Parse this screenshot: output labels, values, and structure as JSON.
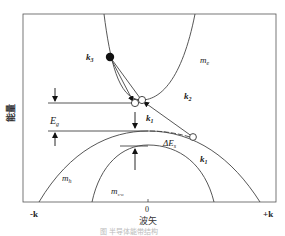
{
  "diagram": {
    "y_axis_label": "能量",
    "x_axis_label": "波矢",
    "x_ticks": {
      "left": "-k",
      "center": "0",
      "right": "+k"
    },
    "bands": [
      {
        "id": "conduction",
        "mass_label": "m",
        "mass_sub": "e"
      },
      {
        "id": "heavy-hole",
        "mass_label": "m",
        "mass_sub": "h"
      },
      {
        "id": "split-off",
        "mass_label": "m",
        "mass_sub": "s-o"
      }
    ],
    "energy_labels": {
      "band_gap": {
        "main": "E",
        "sub": "g"
      },
      "split_off_gap": {
        "main": "ΔE",
        "sub": "s"
      }
    },
    "wavevector_labels": {
      "k1_center": {
        "main": "k",
        "sub": "1"
      },
      "k2": {
        "main": "k",
        "sub": "2"
      },
      "k3": {
        "main": "k",
        "sub": "3"
      },
      "k1_valence": {
        "main": "k",
        "sub": "1"
      }
    },
    "caption": "图  半导体能带结构"
  }
}
